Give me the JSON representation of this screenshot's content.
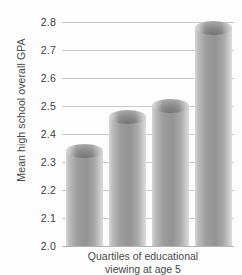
{
  "chart_data": {
    "type": "bar",
    "title": "",
    "categories": [
      "1",
      "2",
      "3",
      "4"
    ],
    "values": [
      2.34,
      2.46,
      2.5,
      2.78
    ],
    "xlabel": "Quartiles of educational viewing at age 5",
    "xlabel_line1": "Quartiles of educational",
    "xlabel_line2": "viewing at age 5",
    "ylabel": "Mean high school overall GPA",
    "ylim": [
      2.0,
      2.8
    ],
    "ytick_step": 0.1,
    "yticks": [
      "2.0",
      "2.1",
      "2.2",
      "2.3",
      "2.4",
      "2.5",
      "2.6",
      "2.7",
      "2.8"
    ],
    "grid": true,
    "legend": false,
    "bar_color": "#9a9a9a",
    "grid_color": "#c8c8c8",
    "style": "3d-cylinder"
  }
}
